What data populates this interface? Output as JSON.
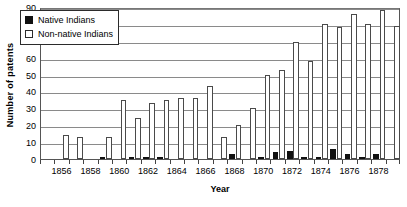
{
  "chart_data": {
    "type": "bar",
    "title": "",
    "xlabel": "Year",
    "ylabel": "Number of patents",
    "ylim": [
      0,
      90
    ],
    "ytick_step": 10,
    "yticks": [
      0,
      10,
      20,
      30,
      40,
      50,
      60,
      70,
      80,
      90
    ],
    "grid": true,
    "legend_position": "upper-left-inside",
    "xlim": [
      1855,
      1879
    ],
    "categories": [
      1855,
      1856,
      1857,
      1858,
      1859,
      1860,
      1861,
      1862,
      1863,
      1864,
      1865,
      1866,
      1867,
      1868,
      1869,
      1870,
      1871,
      1872,
      1873,
      1874,
      1875,
      1876,
      1877,
      1878,
      1879
    ],
    "xtick_labels": [
      "1856",
      "1858",
      "1860",
      "1862",
      "1864",
      "1866",
      "1868",
      "1870",
      "1872",
      "1874",
      "1876",
      "1878"
    ],
    "xtick_label_years": [
      1856,
      1858,
      1860,
      1862,
      1864,
      1866,
      1868,
      1870,
      1872,
      1874,
      1876,
      1878
    ],
    "series": [
      {
        "name": "Native Indians",
        "color": "#111111",
        "swatch": "filled-square",
        "values": [
          0,
          0,
          0,
          0,
          1,
          0,
          1,
          1,
          1,
          0,
          0,
          0,
          0,
          3,
          0,
          1,
          4,
          5,
          1,
          1,
          6,
          3,
          1,
          3,
          0
        ]
      },
      {
        "name": "Non-native Indians",
        "color": "#ffffff",
        "swatch": "hollow-square",
        "values": [
          0,
          14,
          13,
          0,
          13,
          35,
          24,
          33,
          35,
          36,
          36,
          43,
          13,
          20,
          30,
          50,
          53,
          69,
          58,
          80,
          78,
          86,
          80,
          88,
          79
        ]
      }
    ]
  },
  "legend": {
    "items": [
      {
        "label": "Native Indians",
        "swatch": "filled"
      },
      {
        "label": "Non-native Indians",
        "swatch": "hollow"
      }
    ]
  },
  "axes": {
    "y_title": "Number of patents",
    "x_title": "Year"
  }
}
